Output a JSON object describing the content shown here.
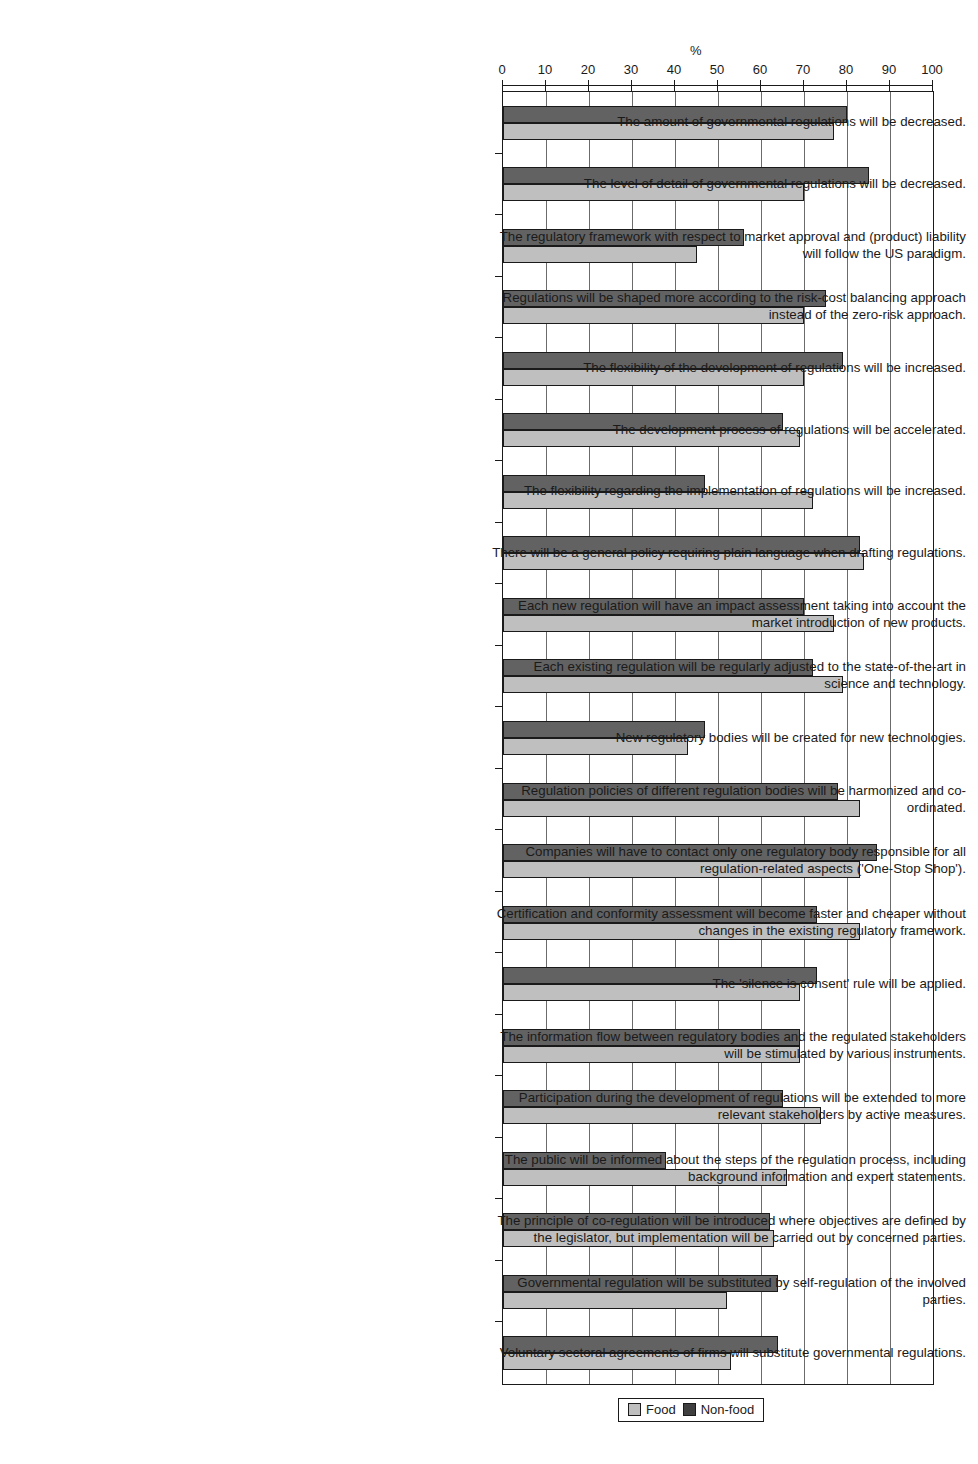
{
  "chart_data": {
    "type": "bar",
    "orientation": "horizontal",
    "title": "",
    "xlabel": "%",
    "ylabel": "",
    "xlim": [
      0,
      100
    ],
    "xticks": [
      0,
      10,
      20,
      30,
      40,
      50,
      60,
      70,
      80,
      90,
      100
    ],
    "grid": true,
    "legend_position": "bottom",
    "colors": {
      "food": "#bfbfbf",
      "nonfood": "#626262",
      "axis": "#1a1a1a",
      "grid": "#6b6b6b"
    },
    "categories": [
      "The amount of governmental regulations will be decreased.",
      "The level of detail of governmental regulations will be decreased.",
      "The regulatory framework with respect to market approval and (product) liability will follow the US paradigm.",
      "Regulations will be shaped more according to the risk-cost balancing approach instead of the zero-risk approach.",
      "The flexibility of the development of regulations will be increased.",
      "The development process of regulations will be accelerated.",
      "The flexibility regarding the implementation of regulations will be increased.",
      "There will be a general policy requiring plain language when drafting regulations.",
      "Each new regulation will have an impact assessment taking into account the market introduction of new products.",
      "Each existing regulation will be regularly adjusted to the state-of-the-art in science and technology.",
      "New regulatory bodies will be created for new technologies.",
      "Regulation policies of different regulation bodies will be harmonized and co-ordinated.",
      "Companies will have to contact only one regulatory body responsible for all regulation-related aspects ('One-Stop Shop').",
      "Certification and conformity assessment will become faster and cheaper without changes in the existing regulatory framework.",
      "The 'silence is consent' rule will be applied.",
      "The information flow between regulatory bodies and the regulated stakeholders will be stimulated by various instruments.",
      "Participation during the development of regulations will be extended to more relevant stakeholders by active measures.",
      "The public will be informed about the steps of the regulation process, including background information and expert statements.",
      "The principle of co-regulation will be introduced where objectives are defined by the legislator, but implementation will be carried out by concerned parties.",
      "Governmental regulation will be substituted by self-regulation of the involved parties.",
      "Voluntary sectoral agreements of firms will substitute governmental regulations."
    ],
    "series": [
      {
        "name": "Non-food",
        "color": "#626262",
        "values": [
          80,
          85,
          56,
          75,
          79,
          65,
          47,
          83,
          70,
          72,
          47,
          78,
          87,
          73,
          73,
          69,
          65,
          38,
          62,
          64,
          64
        ]
      },
      {
        "name": "Food",
        "color": "#bfbfbf",
        "values": [
          77,
          70,
          45,
          70,
          70,
          69,
          72,
          84,
          77,
          79,
          43,
          83,
          83,
          83,
          69,
          69,
          74,
          66,
          63,
          52,
          53
        ]
      }
    ]
  },
  "legend": {
    "items": [
      {
        "label": "Food",
        "swatch": "food-swatch"
      },
      {
        "label": "Non-food",
        "swatch": "nonfood-swatch"
      }
    ]
  },
  "axis": {
    "percent_symbol": "%"
  }
}
